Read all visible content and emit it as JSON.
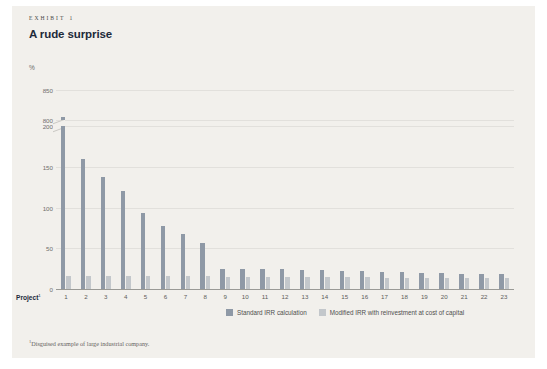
{
  "card": {
    "exhibit_prefix": "EXHIBIT",
    "exhibit_number": "1",
    "title": "A rude surprise",
    "unit": "%",
    "footnote_marker": "1",
    "footnote": "Disguised example of large industrial company.",
    "project_axis_label": "Project",
    "project_axis_marker": "1"
  },
  "colors": {
    "card_background": "#f2f0ec",
    "standard_bar": "#8f99a6",
    "modified_bar": "#c3c7cb",
    "title": "#1d2a3a",
    "gridline": "#e2e0dc",
    "baseline": "#9a9a96"
  },
  "legend": {
    "items": [
      {
        "label": "Standard IRR calculation",
        "color": "#8f99a6"
      },
      {
        "label": "Modified IRR with reinvestment at cost of capital",
        "color": "#c3c7cb"
      }
    ]
  },
  "chart_data": {
    "type": "bar",
    "title": "A rude surprise",
    "xlabel": "Project",
    "ylabel": "%",
    "grid": true,
    "legend_position": "bottom",
    "axis_break": {
      "from": 200,
      "to": 800
    },
    "ytick_labels": [
      "0",
      "50",
      "100",
      "150",
      "200",
      "800",
      "850"
    ],
    "ytick_values": [
      0,
      50,
      100,
      150,
      200,
      800,
      850
    ],
    "ylim": [
      0,
      850
    ],
    "categories": [
      "1",
      "2",
      "3",
      "4",
      "5",
      "6",
      "7",
      "8",
      "9",
      "10",
      "11",
      "12",
      "13",
      "14",
      "15",
      "16",
      "17",
      "18",
      "19",
      "20",
      "21",
      "22",
      "23"
    ],
    "series": [
      {
        "name": "Standard IRR calculation",
        "color": "#8f99a6",
        "values": [
          805,
          160,
          137,
          120,
          93,
          77,
          68,
          56,
          25,
          25,
          24,
          24,
          23,
          23,
          22,
          22,
          21,
          21,
          20,
          20,
          19,
          19,
          18
        ]
      },
      {
        "name": "Modified IRR with reinvestment at cost of capital",
        "color": "#c3c7cb",
        "values": [
          16,
          16,
          16,
          16,
          16,
          16,
          16,
          16,
          15,
          15,
          15,
          15,
          15,
          15,
          15,
          15,
          14,
          14,
          14,
          14,
          14,
          14,
          13
        ]
      }
    ]
  }
}
